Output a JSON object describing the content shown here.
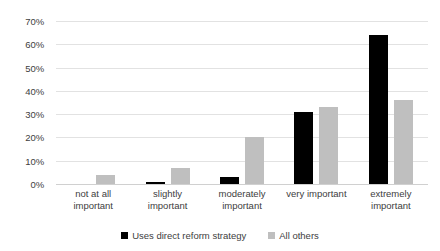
{
  "chart_data": {
    "type": "bar",
    "title": "",
    "subtitle": "",
    "xlabel": "",
    "ylabel": "",
    "ylim": [
      0,
      70
    ],
    "ytick_labels": [
      "70%",
      "60%",
      "50%",
      "40%",
      "30%",
      "20%",
      "10%",
      "0%"
    ],
    "ytick_values": [
      70,
      60,
      50,
      40,
      30,
      20,
      10,
      0
    ],
    "grid": true,
    "legend_position": "bottom-center",
    "categories": [
      "not at all important",
      "slightly important",
      "moderately important",
      "very important",
      "extremely important"
    ],
    "category_lines": [
      [
        "not at all",
        "important"
      ],
      [
        "slightly important"
      ],
      [
        "moderately",
        "important"
      ],
      [
        "very important"
      ],
      [
        "extremely",
        "important"
      ]
    ],
    "series": [
      {
        "name": "Uses direct reform strategy",
        "color": "#000000",
        "values": [
          0,
          1,
          3,
          31,
          64
        ]
      },
      {
        "name": "All others",
        "color": "#bfbfbf",
        "values": [
          4,
          7,
          20,
          33,
          36
        ]
      }
    ]
  }
}
